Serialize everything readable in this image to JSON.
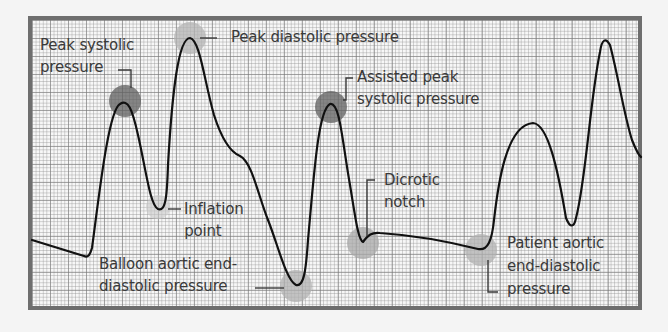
{
  "colors": {
    "frame_border": "#6e6e6e",
    "grid": "#9a9a9a",
    "waveform": "#111111",
    "highlight_dark": "#6a6a6a",
    "highlight_light": "#b8b8b8",
    "label_text": "#3a3a3a"
  },
  "labels": {
    "peak_systolic": {
      "line1": "Peak systolic",
      "line2": "pressure"
    },
    "peak_diastolic": {
      "line1": "Peak diastolic pressure"
    },
    "assisted_peak_systolic": {
      "line1": "Assisted peak",
      "line2": "systolic pressure"
    },
    "inflation_point": {
      "line1": "Inflation",
      "line2": "point"
    },
    "dicrotic_notch": {
      "line1": "Dicrotic",
      "line2": "notch"
    },
    "balloon_aortic_end_diastolic": {
      "line1": "Balloon aortic end-",
      "line2": "diastolic pressure"
    },
    "patient_aortic_end_diastolic": {
      "line1": "Patient aortic",
      "line2": "end-diastolic",
      "line3": "pressure"
    }
  },
  "markers": [
    {
      "name": "peak-systolic-marker",
      "x": 125,
      "y": 101,
      "shade": "dark"
    },
    {
      "name": "peak-diastolic-marker",
      "x": 190,
      "y": 38,
      "shade": "light"
    },
    {
      "name": "assisted-peak-systolic-marker",
      "x": 331,
      "y": 107,
      "shade": "dark"
    },
    {
      "name": "inflation-point-marker",
      "x": 160,
      "y": 207,
      "shade": "light"
    },
    {
      "name": "balloon-aortic-end-diastolic-marker",
      "x": 296,
      "y": 288,
      "shade": "light"
    },
    {
      "name": "dicrotic-notch-marker",
      "x": 363,
      "y": 244,
      "shade": "light"
    },
    {
      "name": "patient-aortic-end-diastolic-marker",
      "x": 481,
      "y": 249,
      "shade": "light"
    }
  ]
}
